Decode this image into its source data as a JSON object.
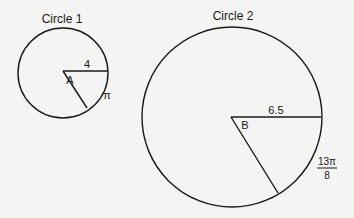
{
  "circle1": {
    "title": "Circle 1",
    "angle_label": "A",
    "radius_label": "4",
    "arc_label": "π"
  },
  "circle2": {
    "title": "Circle 2",
    "angle_label": "B",
    "radius_label": "6.5",
    "arc_label_numerator": "13π",
    "arc_label_denominator": "8"
  },
  "colors": {
    "stroke": "#1a1a1a",
    "background": "#f4f4f2"
  }
}
